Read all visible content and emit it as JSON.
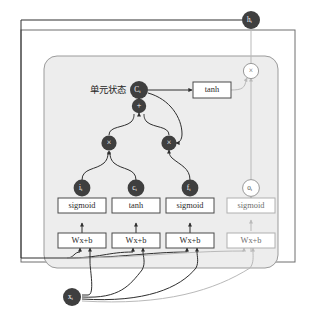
{
  "figure": {
    "cell_state_label": "单元状态",
    "caption": ""
  },
  "colors": {
    "node_dark": "#3f3f3f",
    "node_open_stroke": "#9a9a9a",
    "node_open_fill": "#ffffff",
    "line_dark": "#2e2e2e",
    "line_light": "#b9b9b9",
    "panel_fill": "#ededed",
    "panel_stroke": "#9b9b9b",
    "outer_stroke": "#6e6e6e",
    "box_fill": "#ffffff",
    "box_stroke": "#4a4a4a",
    "box_stroke_dim": "#b0b0b0",
    "text_dark": "#2b2b2b",
    "text_dim": "#6f6f6f",
    "text_white": "#ffffff"
  },
  "nodes": {
    "output": {
      "label": "h",
      "sub": "t",
      "style": "dark"
    },
    "cell_state": {
      "label": "C",
      "sub": "t",
      "style": "dark"
    },
    "input_gate": {
      "label": "i",
      "sub": "t",
      "style": "dark"
    },
    "candidate": {
      "label": "c",
      "sub": "t",
      "style": "dark"
    },
    "forget_gate": {
      "label": "f",
      "sub": "t",
      "style": "dark"
    },
    "output_gate": {
      "label": "o",
      "sub": "t",
      "style": "open"
    },
    "input": {
      "label": "x",
      "sub": "t",
      "style": "dark"
    }
  },
  "operators": {
    "add": {
      "symbol": "+",
      "style": "dark"
    },
    "mul_input": {
      "symbol": "×",
      "style": "dark"
    },
    "mul_forget": {
      "symbol": "×",
      "style": "dark"
    },
    "mul_output": {
      "symbol": "×",
      "style": "open"
    }
  },
  "activation_boxes": [
    {
      "id": "tanh-top",
      "label": "tanh",
      "style": "solid"
    },
    {
      "id": "act-1",
      "label": "sigmoid",
      "style": "solid"
    },
    {
      "id": "act-2",
      "label": "tanh",
      "style": "solid"
    },
    {
      "id": "act-3",
      "label": "sigmoid",
      "style": "solid"
    },
    {
      "id": "act-4",
      "label": "sigmoid",
      "style": "dim"
    }
  ],
  "affine_boxes": [
    {
      "id": "affine-1",
      "label": "Wx+b",
      "style": "solid"
    },
    {
      "id": "affine-2",
      "label": "Wx+b",
      "style": "solid"
    },
    {
      "id": "affine-3",
      "label": "Wx+b",
      "style": "solid"
    },
    {
      "id": "affine-4",
      "label": "Wx+b",
      "style": "dim"
    }
  ]
}
